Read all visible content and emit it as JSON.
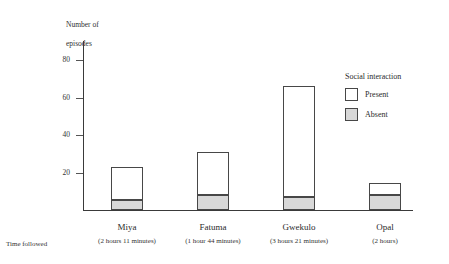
{
  "chart_data": {
    "type": "bar",
    "title": "",
    "subtitle": "",
    "stacked": true,
    "ylabel": "Number of\nepisodes",
    "xlabel": "Time followed",
    "ylim": [
      0,
      88
    ],
    "yticks": [
      20,
      40,
      60,
      80
    ],
    "ytick_labels": [
      "20",
      "40",
      "60",
      "80"
    ],
    "grid": false,
    "categories": [
      "Miya",
      "Fatuma",
      "Gwekulo",
      "Opal"
    ],
    "category_sublabels": [
      "(2 hours 11 minutes)",
      "(1 hour 44 minutes)",
      "(3 hours 21 minutes)",
      "(2 hours)"
    ],
    "legend_title": "Social interaction",
    "legend_position": "right",
    "series": [
      {
        "name": "Absent",
        "color": "#d8d8d8",
        "values": [
          5,
          8,
          7,
          8
        ]
      },
      {
        "name": "Present",
        "color": "#ffffff",
        "values": [
          18,
          23,
          59,
          6
        ]
      }
    ],
    "totals": [
      23,
      31,
      66,
      14
    ],
    "annotations": []
  },
  "axis": {
    "tick_20": "20",
    "tick_40": "40",
    "tick_60": "60",
    "tick_80": "80"
  },
  "y_title_line1": "Number of",
  "y_title_line2": "episodes",
  "x_axis_row_label": "Time followed",
  "legend": {
    "title": "Social interaction",
    "present_label": "Present",
    "absent_label": "Absent"
  },
  "categories": [
    {
      "name": "Miya",
      "sub": "(2 hours 11 minutes)"
    },
    {
      "name": "Fatuma",
      "sub": "(1 hour 44 minutes)"
    },
    {
      "name": "Gwekulo",
      "sub": "(3 hours 21 minutes)"
    },
    {
      "name": "Opal",
      "sub": "(2 hours)"
    }
  ],
  "colors": {
    "present": "#ffffff",
    "absent": "#d8d8d8",
    "outline": "#474747",
    "axis": "#3a3a3a"
  }
}
